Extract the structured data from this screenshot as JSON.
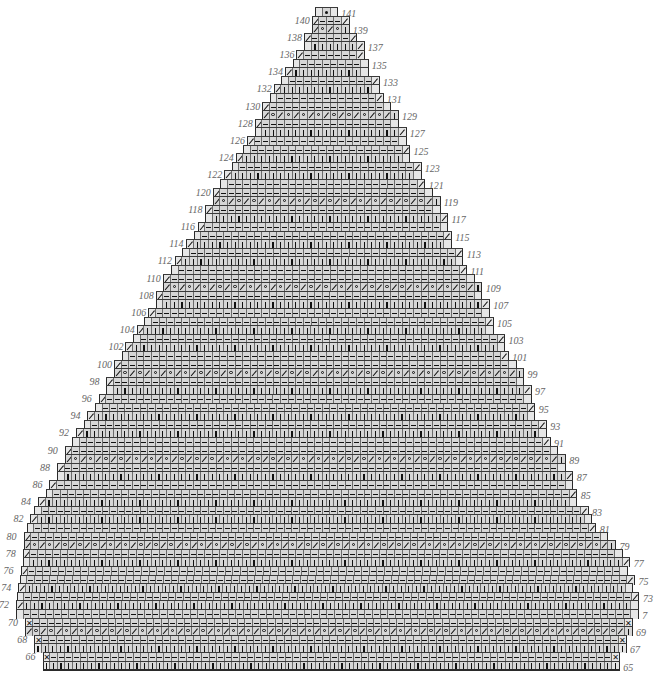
{
  "chart": {
    "row_range": [
      65,
      141
    ],
    "cell_width_px": 7.6,
    "row_height_px": 8.6,
    "origin_x": 16,
    "top_y": 7,
    "colors": {
      "cell": "#d6d6d6",
      "edge_cell": "#e6e6e6",
      "grid": "#6b6b6b",
      "outline": "#2a2a2a",
      "symbol": "#111111",
      "row_number": "#666666"
    }
  },
  "legend_symbols": {
    "k": "knit (vertical bar)",
    "p": "purl (dash)",
    "o": "yarn over (circle)",
    "s": "decrease (slash)",
    "x": "bind/decrease (X)",
    "d": "center dot",
    "b": "blank"
  },
  "row_numbers": {
    "left_even": [
      66,
      68,
      70,
      72,
      74,
      76,
      78,
      80,
      82,
      84,
      86,
      88,
      90,
      92,
      94,
      96,
      98,
      100,
      102,
      104,
      106,
      108,
      110,
      112,
      114,
      116,
      118,
      120,
      122,
      124,
      126,
      128,
      130,
      132,
      134,
      136,
      138,
      140
    ],
    "right_odd": [
      65,
      67,
      69,
      71,
      73,
      75,
      77,
      79,
      81,
      83,
      85,
      87,
      89,
      91,
      93,
      95,
      97,
      99,
      101,
      103,
      105,
      107,
      109,
      111,
      113,
      115,
      117,
      119,
      121,
      123,
      125,
      127,
      129,
      131,
      133,
      135,
      137,
      139,
      141
    ],
    "note_row_71_label": "7"
  },
  "rows": [
    {
      "n": 141,
      "left": 39.4,
      "width": 3,
      "body": "d",
      "lead": "b",
      "tail": "b"
    },
    {
      "n": 140,
      "left": 38.9,
      "width": 5,
      "body": "p",
      "lead": "s",
      "tail": "s"
    },
    {
      "n": 139,
      "left": 38.9,
      "width": 5,
      "body": "so",
      "lead": "s",
      "tail": "k",
      "eyelet": true
    },
    {
      "n": 138,
      "left": 37.9,
      "width": 7,
      "body": "p",
      "lead": "s",
      "tail": "s"
    },
    {
      "n": 137,
      "left": 37.9,
      "width": 8,
      "body": "k",
      "lead": "b",
      "tail": "s"
    },
    {
      "n": 136,
      "left": 36.9,
      "width": 9,
      "body": "p",
      "lead": "s",
      "tail": "s"
    },
    {
      "n": 135,
      "left": 36.4,
      "width": 10,
      "body": "p",
      "lead": "b",
      "tail": "b"
    },
    {
      "n": 134,
      "left": 35.4,
      "width": 11,
      "body": "k",
      "lead": "s",
      "tail": "b"
    },
    {
      "n": 133,
      "left": 34.9,
      "width": 13,
      "body": "p",
      "lead": "b",
      "tail": "s"
    },
    {
      "n": 132,
      "left": 33.9,
      "width": 14,
      "body": "k",
      "lead": "s",
      "tail": "b"
    },
    {
      "n": 131,
      "left": 33.4,
      "width": 15,
      "body": "p",
      "lead": "b",
      "tail": "s"
    },
    {
      "n": 130,
      "left": 32.4,
      "width": 17,
      "body": "p",
      "lead": "s",
      "tail": "b"
    },
    {
      "n": 129,
      "left": 32.4,
      "width": 18,
      "body": "so",
      "lead": "s",
      "tail": "k",
      "eyelet": true
    },
    {
      "n": 128,
      "left": 31.4,
      "width": 19,
      "body": "p",
      "lead": "s",
      "tail": "b"
    },
    {
      "n": 127,
      "left": 31.4,
      "width": 20,
      "body": "k",
      "lead": "b",
      "tail": "s"
    },
    {
      "n": 126,
      "left": 30.4,
      "width": 21,
      "body": "p",
      "lead": "s",
      "tail": "b"
    },
    {
      "n": 125,
      "left": 29.9,
      "width": 22,
      "body": "p",
      "lead": "b",
      "tail": "s"
    },
    {
      "n": 124,
      "left": 28.9,
      "width": 23,
      "body": "k",
      "lead": "s",
      "tail": "b"
    },
    {
      "n": 123,
      "left": 28.4,
      "width": 25,
      "body": "p",
      "lead": "b",
      "tail": "s"
    },
    {
      "n": 122,
      "left": 27.4,
      "width": 26,
      "body": "k",
      "lead": "s",
      "tail": "b"
    },
    {
      "n": 121,
      "left": 26.9,
      "width": 27,
      "body": "p",
      "lead": "b",
      "tail": "s"
    },
    {
      "n": 120,
      "left": 25.9,
      "width": 29,
      "body": "p",
      "lead": "s",
      "tail": "b"
    },
    {
      "n": 119,
      "left": 25.9,
      "width": 30,
      "body": "so",
      "lead": "s",
      "tail": "k",
      "eyelet": true
    },
    {
      "n": 118,
      "left": 24.9,
      "width": 31,
      "body": "p",
      "lead": "s",
      "tail": "b"
    },
    {
      "n": 117,
      "left": 24.9,
      "width": 32,
      "body": "k",
      "lead": "b",
      "tail": "s"
    },
    {
      "n": 116,
      "left": 23.9,
      "width": 33,
      "body": "p",
      "lead": "s",
      "tail": "b"
    },
    {
      "n": 115,
      "left": 23.4,
      "width": 34,
      "body": "p",
      "lead": "b",
      "tail": "s"
    },
    {
      "n": 114,
      "left": 22.4,
      "width": 35,
      "body": "k",
      "lead": "s",
      "tail": "b"
    },
    {
      "n": 113,
      "left": 21.9,
      "width": 37,
      "body": "p",
      "lead": "b",
      "tail": "s"
    },
    {
      "n": 112,
      "left": 20.9,
      "width": 38,
      "body": "k",
      "lead": "s",
      "tail": "b"
    },
    {
      "n": 111,
      "left": 20.4,
      "width": 39,
      "body": "p",
      "lead": "b",
      "tail": "s"
    },
    {
      "n": 110,
      "left": 19.4,
      "width": 41,
      "body": "p",
      "lead": "s",
      "tail": "b"
    },
    {
      "n": 109,
      "left": 19.4,
      "width": 42,
      "body": "so",
      "lead": "s",
      "tail": "k",
      "eyelet": true
    },
    {
      "n": 108,
      "left": 18.4,
      "width": 43,
      "body": "p",
      "lead": "s",
      "tail": "b"
    },
    {
      "n": 107,
      "left": 18.4,
      "width": 44,
      "body": "k",
      "lead": "b",
      "tail": "s"
    },
    {
      "n": 106,
      "left": 17.4,
      "width": 45,
      "body": "p",
      "lead": "s",
      "tail": "b"
    },
    {
      "n": 105,
      "left": 16.9,
      "width": 46,
      "body": "p",
      "lead": "b",
      "tail": "s"
    },
    {
      "n": 104,
      "left": 15.9,
      "width": 47,
      "body": "k",
      "lead": "s",
      "tail": "b"
    },
    {
      "n": 103,
      "left": 15.4,
      "width": 49,
      "body": "p",
      "lead": "b",
      "tail": "s"
    },
    {
      "n": 102,
      "left": 14.4,
      "width": 50,
      "body": "k",
      "lead": "s",
      "tail": "b"
    },
    {
      "n": 101,
      "left": 13.9,
      "width": 51,
      "body": "p",
      "lead": "b",
      "tail": "s"
    },
    {
      "n": 100,
      "left": 12.9,
      "width": 53,
      "body": "p",
      "lead": "s",
      "tail": "b"
    },
    {
      "n": 99,
      "left": 12.9,
      "width": 54,
      "body": "so",
      "lead": "s",
      "tail": "k",
      "eyelet": true
    },
    {
      "n": 98,
      "left": 11.9,
      "width": 55,
      "body": "p",
      "lead": "s",
      "tail": "b"
    },
    {
      "n": 97,
      "left": 11.9,
      "width": 56,
      "body": "k",
      "lead": "b",
      "tail": "s"
    },
    {
      "n": 96,
      "left": 10.9,
      "width": 57,
      "body": "p",
      "lead": "s",
      "tail": "b"
    },
    {
      "n": 95,
      "left": 10.4,
      "width": 58,
      "body": "p",
      "lead": "b",
      "tail": "s"
    },
    {
      "n": 94,
      "left": 9.4,
      "width": 59,
      "body": "k",
      "lead": "s",
      "tail": "b"
    },
    {
      "n": 93,
      "left": 8.9,
      "width": 61,
      "body": "p",
      "lead": "b",
      "tail": "s"
    },
    {
      "n": 92,
      "left": 7.9,
      "width": 62,
      "body": "k",
      "lead": "s",
      "tail": "b"
    },
    {
      "n": 91,
      "left": 7.4,
      "width": 63,
      "body": "p",
      "lead": "b",
      "tail": "s"
    },
    {
      "n": 90,
      "left": 6.4,
      "width": 65,
      "body": "p",
      "lead": "s",
      "tail": "b"
    },
    {
      "n": 89,
      "left": 6.4,
      "width": 66,
      "body": "so",
      "lead": "s",
      "tail": "k",
      "eyelet": true
    },
    {
      "n": 88,
      "left": 5.4,
      "width": 67,
      "body": "p",
      "lead": "s",
      "tail": "b"
    },
    {
      "n": 87,
      "left": 5.4,
      "width": 68,
      "body": "k",
      "lead": "b",
      "tail": "s"
    },
    {
      "n": 86,
      "left": 4.4,
      "width": 69,
      "body": "p",
      "lead": "s",
      "tail": "b"
    },
    {
      "n": 85,
      "left": 3.9,
      "width": 70,
      "body": "p",
      "lead": "b",
      "tail": "s"
    },
    {
      "n": 84,
      "left": 2.9,
      "width": 71,
      "body": "k",
      "lead": "s",
      "tail": "b"
    },
    {
      "n": 83,
      "left": 2.4,
      "width": 73,
      "body": "p",
      "lead": "b",
      "tail": "s"
    },
    {
      "n": 82,
      "left": 1.9,
      "width": 74,
      "body": "k",
      "lead": "s",
      "tail": "b"
    },
    {
      "n": 81,
      "left": 1.4,
      "width": 75,
      "body": "p",
      "lead": "b",
      "tail": "s"
    },
    {
      "n": 80,
      "left": 1.0,
      "width": 77,
      "body": "p",
      "lead": "s",
      "tail": "b"
    },
    {
      "n": 79,
      "left": 1.0,
      "width": 78,
      "body": "so",
      "lead": "s",
      "tail": "k",
      "eyelet": true
    },
    {
      "n": 78,
      "left": 0.9,
      "width": 79,
      "body": "p",
      "lead": "s",
      "tail": "b"
    },
    {
      "n": 77,
      "left": 0.9,
      "width": 80,
      "body": "k",
      "lead": "b",
      "tail": "s"
    },
    {
      "n": 76,
      "left": 0.6,
      "width": 80,
      "body": "p",
      "lead": "s",
      "tail": "b"
    },
    {
      "n": 75,
      "left": 0.5,
      "width": 81,
      "body": "p",
      "lead": "b",
      "tail": "s"
    },
    {
      "n": 74,
      "left": 0.3,
      "width": 81,
      "body": "k",
      "lead": "s",
      "tail": "b"
    },
    {
      "n": 73,
      "left": 0.1,
      "width": 82,
      "body": "p",
      "lead": "b",
      "tail": "s"
    },
    {
      "n": 72,
      "left": 0,
      "width": 82,
      "body": "k",
      "lead": "s",
      "tail": "b"
    },
    {
      "n": 71,
      "left": 0,
      "width": 82,
      "body": "p",
      "lead": "b",
      "tail": "b"
    },
    {
      "n": 70,
      "left": 1.2,
      "width": 80,
      "body": "p",
      "lead": "x",
      "tail": "x"
    },
    {
      "n": 69,
      "left": 1.2,
      "width": 80,
      "body": "so",
      "lead": "s",
      "tail": "k",
      "eyelet": true
    },
    {
      "n": 68,
      "left": 2.4,
      "width": 78,
      "body": "p",
      "lead": "x",
      "tail": "x"
    },
    {
      "n": 67,
      "left": 2.4,
      "width": 78,
      "body": "k",
      "lead": "k",
      "tail": "k"
    },
    {
      "n": 66,
      "left": 3.5,
      "width": 76,
      "body": "p",
      "lead": "x",
      "tail": "x"
    },
    {
      "n": 65,
      "left": 3.5,
      "width": 76,
      "body": "k",
      "lead": "k",
      "tail": "k"
    }
  ]
}
